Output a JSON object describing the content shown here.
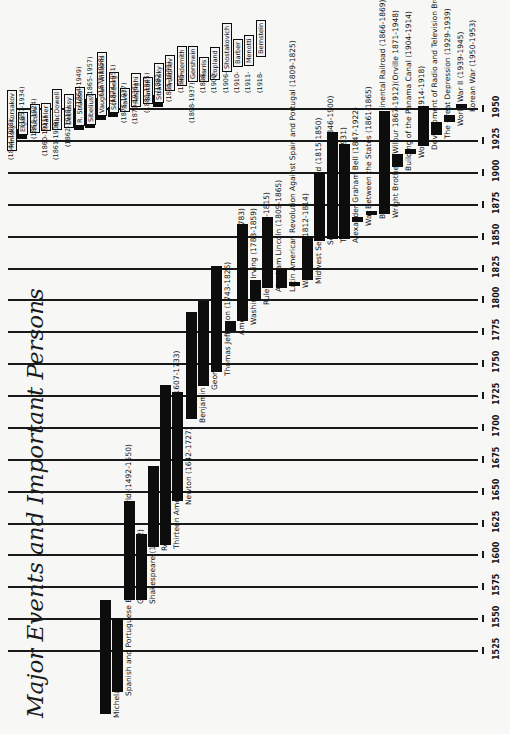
{
  "title": "Major Events and Important Persons",
  "axis": {
    "ticks": [
      "1525",
      "1550",
      "1575",
      "1600",
      "1625",
      "1650",
      "1675",
      "1700",
      "1725",
      "1750",
      "1775",
      "1800",
      "1825",
      "1850",
      "1875",
      "1900",
      "1925",
      "1950"
    ]
  },
  "chart_data": {
    "type": "bar",
    "title": "Major Events and Important Persons",
    "orientation": "timeline (rotated 90°; years increase toward top of page)",
    "xlabel": "",
    "ylabel": "Year",
    "ylim": [
      1525,
      1950
    ],
    "grid": true,
    "series": [
      {
        "name": "Michelangelo",
        "start": 1475,
        "end": 1564,
        "label": "Michelangelo (1475-1564)"
      },
      {
        "name": "Spanish and Portuguese Exploration of the New World",
        "start": 1492,
        "end": 1550,
        "label": "Spanish and Portuguese Exploration of the New World (1492-1550)"
      },
      {
        "name": "Galileo",
        "start": 1564,
        "end": 1642,
        "label": "Galileo (1564-1642)"
      },
      {
        "name": "Shakespeare",
        "start": 1564,
        "end": 1616,
        "label": "Shakespeare (1564-1616)"
      },
      {
        "name": "Rembrandt",
        "start": 1606,
        "end": 1669,
        "label": "Rembrandt (1606-1669)"
      },
      {
        "name": "Thirteen American Colonies Established",
        "start": 1607,
        "end": 1733,
        "label": "Thirteen American Colonies Established (1607-1733)"
      },
      {
        "name": "Newton",
        "start": 1642,
        "end": 1727,
        "label": "Newton (1642-1727)"
      },
      {
        "name": "Benjamin Franklin",
        "start": 1706,
        "end": 1790,
        "label": "Benjamin Franklin (1706-1790)"
      },
      {
        "name": "George Washington",
        "start": 1732,
        "end": 1799,
        "label": "George Washington (1732-1799)"
      },
      {
        "name": "Thomas Jefferson",
        "start": 1743,
        "end": 1826,
        "label": "Thomas Jefferson (1743-1826)"
      },
      {
        "name": "American Revolution",
        "start": 1775,
        "end": 1783,
        "label": "American Revolution (1775-1783)"
      },
      {
        "name": "Washington Irving",
        "start": 1783,
        "end": 1859,
        "label": "Washington Irving (1783-1859)"
      },
      {
        "name": "Rule of Napoleon",
        "start": 1799,
        "end": 1815,
        "label": "Rule of Napoleon (1799-1815)"
      },
      {
        "name": "Abraham Lincoln",
        "start": 1809,
        "end": 1865,
        "label": "Abraham Lincoln (1809-1865)"
      },
      {
        "name": "Latin American Revolution Against Spain and Portugal",
        "start": 1809,
        "end": 1825,
        "label": "Latin American Revolution Against Spain and Portugal (1809-1825)"
      },
      {
        "name": "War of 1812",
        "start": 1812,
        "end": 1814,
        "label": "War of 1812 (1812-1814)"
      },
      {
        "name": "Midwest Section of U.S. Settled",
        "start": 1815,
        "end": 1850,
        "label": "Midwest Section of U.S. Settled (1815-1850)"
      },
      {
        "name": "Settlement of the Far West",
        "start": 1846,
        "end": 1900,
        "label": "Settlement of the Far West (1846-1900)"
      },
      {
        "name": "Thomas A. Edison",
        "start": 1847,
        "end": 1931,
        "label": "Thomas A. Edison (1847-1931)"
      },
      {
        "name": "Alexander Graham Bell",
        "start": 1847,
        "end": 1922,
        "label": "Alexander Graham Bell (1847-1922)"
      },
      {
        "name": "War Between the States",
        "start": 1861,
        "end": 1865,
        "label": "War Between the States (1861-1865)"
      },
      {
        "name": "Building of the First Transcontinental Railroad",
        "start": 1866,
        "end": 1869,
        "label": "Building of the First Transcontinental Railroad (1866-1869)"
      },
      {
        "name": "Wright Brothers",
        "start": 1867,
        "end": 1948,
        "label": "Wright Brothers (Wilbur 1867-1912)(Orville 1871-1948)"
      },
      {
        "name": "Building of the Panama Canal",
        "start": 1904,
        "end": 1914,
        "label": "Building of the Panama Canal (1904-1914)"
      },
      {
        "name": "World War I",
        "start": 1914,
        "end": 1918,
        "label": "World War I (1914-1918)"
      },
      {
        "name": "Development of Radio and Television Broadcasting",
        "start": 1920,
        "end": 1952,
        "label": "Development of Radio and Television Broadcasting (1920-1952)"
      },
      {
        "name": "The Great Depression",
        "start": 1929,
        "end": 1939,
        "label": "The Great Depression (1929-1939)"
      },
      {
        "name": "World War II",
        "start": 1939,
        "end": 1945,
        "label": "World War II (1939-1945)"
      },
      {
        "name": "Korean War",
        "start": 1950,
        "end": 1953,
        "label": "Korean War (1950-1953)"
      }
    ],
    "composers": [
      {
        "name": "Rimsky-Korsakov",
        "start": 1844,
        "end": 1908,
        "years": "(1844-1908)"
      },
      {
        "name": "Elgar",
        "start": 1857,
        "end": 1934,
        "years": "(1857-1934)"
      },
      {
        "name": "Puccini",
        "start": 1858,
        "end": 1924,
        "years": "(1858-1924)"
      },
      {
        "name": "Mahler",
        "start": 1860,
        "end": 1911,
        "years": "(1860-1911)"
      },
      {
        "name": "MacDowell",
        "start": 1861,
        "end": 1908,
        "years": "(1861-1908)"
      },
      {
        "name": "Debussy",
        "start": 1862,
        "end": 1918,
        "years": "(1862-1918)"
      },
      {
        "name": "R. Strauss",
        "start": 1864,
        "end": 1949,
        "years": "(1864-1949)"
      },
      {
        "name": "Sibelius",
        "start": 1865,
        "end": 1957,
        "years": "(1865-1957)"
      },
      {
        "name": "Vaughan Williams",
        "start": 1872,
        "end": 1958,
        "years": "(1872-1958)"
      },
      {
        "name": "Schönberg",
        "start": 1874,
        "end": 1951,
        "years": "(1874-1951)"
      },
      {
        "name": "Ravel",
        "start": 1875,
        "end": 1937,
        "years": "(1875-1937)"
      },
      {
        "name": "Respighi",
        "start": 1879,
        "end": 1936,
        "years": "(1879-1936)"
      },
      {
        "name": "Bartók",
        "start": 1881,
        "end": 1945,
        "years": "(1881-1945)"
      },
      {
        "name": "Stravinsky",
        "start": 1882,
        "end": null,
        "years": "(1882-"
      },
      {
        "name": "Prokofiev",
        "start": 1891,
        "end": 1953,
        "years": "(1891-1953)"
      },
      {
        "name": "Hindemith",
        "start": 1895,
        "end": null,
        "years": "(1895-"
      },
      {
        "name": "Gershwin",
        "start": 1898,
        "end": 1937,
        "years": "(1898-1937)"
      },
      {
        "name": "Harris",
        "start": 1898,
        "end": null,
        "years": "(1898-"
      },
      {
        "name": "Copland",
        "start": 1900,
        "end": null,
        "years": "(1900-"
      },
      {
        "name": "Shostakovich",
        "start": 1906,
        "end": null,
        "years": "(1906-"
      },
      {
        "name": "Barber",
        "start": 1910,
        "end": null,
        "years": "(1910-"
      },
      {
        "name": "Menotti",
        "start": 1911,
        "end": null,
        "years": "(1911-"
      },
      {
        "name": "Bernstein",
        "start": 1918,
        "end": null,
        "years": "(1918-"
      }
    ]
  }
}
